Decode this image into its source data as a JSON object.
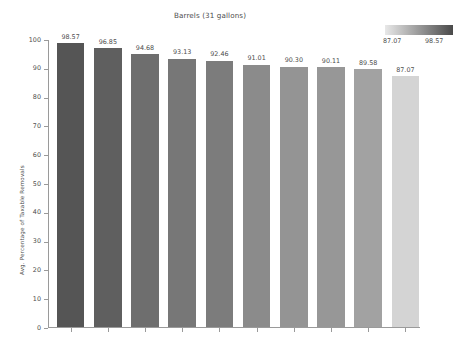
{
  "chart_data": {
    "type": "bar",
    "title": "Barrels (31 gallons)",
    "xlabel": "",
    "ylabel": "Avg. Percentage of Taxable Removals",
    "ylim": [
      0,
      100
    ],
    "yticks": [
      0,
      10,
      20,
      30,
      40,
      50,
      60,
      70,
      80,
      90,
      100
    ],
    "ytick_labels": [
      "0",
      "10",
      "20",
      "30",
      "40",
      "50",
      "60",
      "70",
      "80",
      "90",
      "100"
    ],
    "grid": false,
    "legend_position": "top-right",
    "categories": [
      "1,000,00...",
      "2,000,00...",
      "1,000,00...",
      "1,001 to ...",
      "6,000,00...",
      "1 to 1,00...",
      "30,001 t...",
      "60,001 t...",
      "500,001...",
      "7,501 to ..."
    ],
    "values": [
      98.57,
      96.85,
      94.68,
      93.13,
      92.46,
      91.01,
      90.3,
      90.11,
      89.58,
      87.07
    ],
    "value_labels": [
      "98.57",
      "96.85",
      "94.68",
      "93.13",
      "92.46",
      "91.01",
      "90.30",
      "90.11",
      "89.58",
      "87.07"
    ],
    "bar_colors": [
      "#555555",
      "#5f5f5f",
      "#6e6e6e",
      "#777777",
      "#7c7c7c",
      "#8b8b8b",
      "#949494",
      "#979797",
      "#a2a2a2",
      "#d4d4d4"
    ],
    "colorbar": {
      "min_label": "87.07",
      "max_label": "98.57",
      "min_color": "#e8e8e8",
      "max_color": "#4a4a4a"
    }
  }
}
